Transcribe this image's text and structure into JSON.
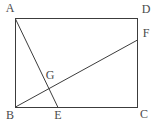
{
  "figure": {
    "kind": "plane-geometry-diagram",
    "canvas": {
      "width": 163,
      "height": 128,
      "background": "#ffffff"
    },
    "style": {
      "stroke_color": "#3c3c3c",
      "stroke_width": 1,
      "label_color": "#4a4a4a",
      "label_font_size": 12
    },
    "points": {
      "A": {
        "label": "A",
        "x": 15,
        "y": 19,
        "role": "rectangle-corner-top-left"
      },
      "D": {
        "label": "D",
        "x": 138,
        "y": 19,
        "role": "rectangle-corner-top-right"
      },
      "C": {
        "label": "C",
        "x": 138,
        "y": 107,
        "role": "rectangle-corner-bottom-right"
      },
      "B": {
        "label": "B",
        "x": 15,
        "y": 107,
        "role": "rectangle-corner-bottom-left"
      },
      "E": {
        "label": "E",
        "x": 58,
        "y": 107,
        "role": "point-on-base-BC"
      },
      "F": {
        "label": "F",
        "x": 138,
        "y": 40,
        "role": "point-on-side-DC"
      },
      "G": {
        "label": "G",
        "x": 49,
        "y": 86,
        "role": "intersection-of-AE-and-BF"
      }
    },
    "shapes": {
      "rectangle": {
        "name": "rectangle-ABCD",
        "vertices": [
          "A",
          "D",
          "C",
          "B"
        ]
      },
      "segments": [
        {
          "name": "segment-AE",
          "from": "A",
          "to": "E"
        },
        {
          "name": "segment-BF",
          "from": "B",
          "to": "F"
        }
      ]
    },
    "labels": [
      {
        "key": "A",
        "text": "A"
      },
      {
        "key": "D",
        "text": "D"
      },
      {
        "key": "F",
        "text": "F"
      },
      {
        "key": "G",
        "text": "G"
      },
      {
        "key": "B",
        "text": "B"
      },
      {
        "key": "E",
        "text": "E"
      },
      {
        "key": "C",
        "text": "C"
      }
    ]
  }
}
